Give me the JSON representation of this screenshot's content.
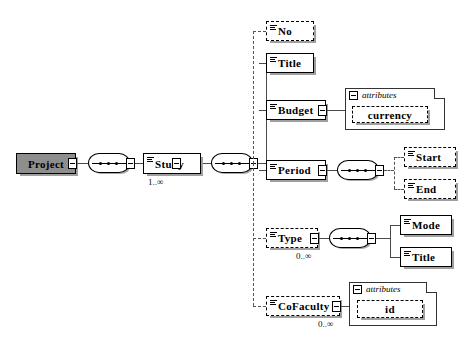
{
  "diagram": {
    "root": {
      "name": "Project",
      "icon": "element-icon",
      "required": true
    },
    "sequence_icon": "sequence-compositor-icon",
    "attributes_label": "attributes",
    "collapse_icon": "minus-box-icon",
    "study": {
      "name": "Study",
      "cardinality": "1..∞",
      "required": true,
      "repeating": true
    },
    "children": [
      {
        "name": "No",
        "cardinality": "",
        "required": false
      },
      {
        "name": "Title",
        "cardinality": "",
        "required": true
      },
      {
        "name": "Budget",
        "cardinality": "",
        "required": true
      },
      {
        "name": "Period",
        "cardinality": "",
        "required": true
      },
      {
        "name": "Type",
        "cardinality": "0..∞",
        "required": false
      },
      {
        "name": "CoFaculty",
        "cardinality": "0..∞",
        "required": false
      }
    ],
    "budget_attributes": [
      {
        "name": "currency",
        "required": false
      }
    ],
    "period_children": [
      {
        "name": "Start",
        "required": false
      },
      {
        "name": "End",
        "required": false
      }
    ],
    "type_children": [
      {
        "name": "Mode",
        "required": true
      },
      {
        "name": "Title",
        "required": true
      }
    ],
    "cofaculty_attributes": [
      {
        "name": "id",
        "required": false
      }
    ],
    "colors": {
      "root_fill": "#8e8e8e",
      "box_fill": "#ffffff",
      "line": "#4a4a4a",
      "shadow": "#a0a0a0",
      "border": "#000000"
    }
  }
}
